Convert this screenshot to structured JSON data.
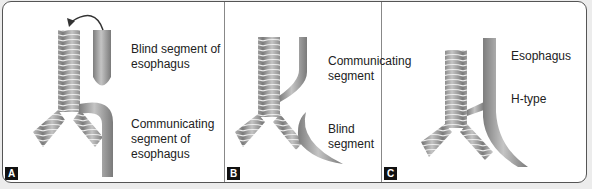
{
  "panels": [
    {
      "id": "A",
      "tag": "A",
      "labels": [
        "Blind segment of\nesophagus",
        "Communicating\nsegment of\nesophagus"
      ]
    },
    {
      "id": "B",
      "tag": "B",
      "labels": [
        "Communicating\nsegment",
        "Blind segment"
      ]
    },
    {
      "id": "C",
      "tag": "C",
      "labels": [
        "Esophagus",
        "H-type"
      ]
    }
  ],
  "colors": {
    "frame": "#555555",
    "tube": "#9a9a9a",
    "background": "#ffffff"
  }
}
